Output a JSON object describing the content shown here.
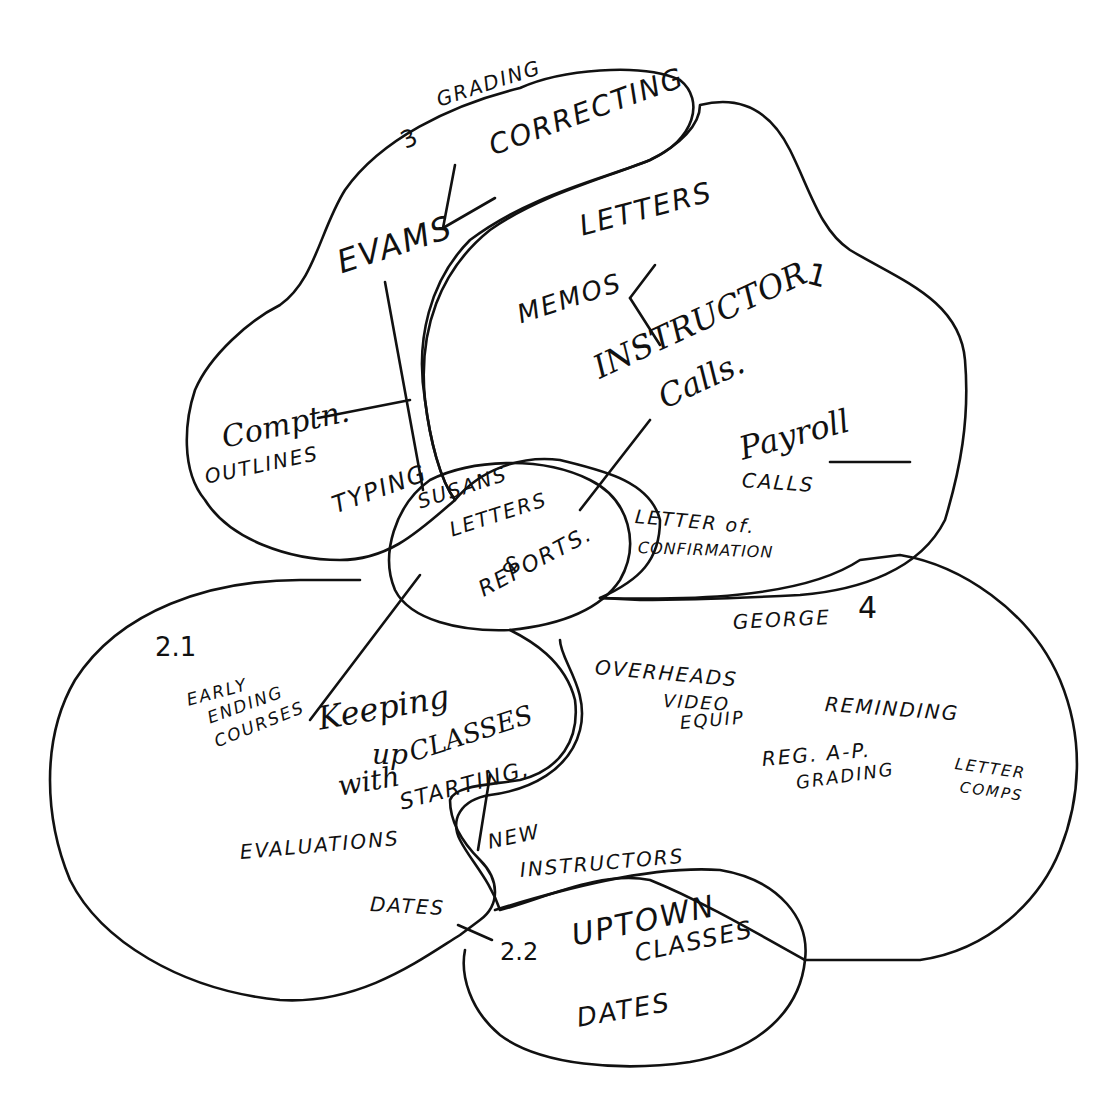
{
  "diagram": {
    "type": "hand-drawn cluster / mind map",
    "colors": {
      "ink": "#111111",
      "paper": "#ffffff"
    },
    "regions": [
      {
        "id": "region-3",
        "number": "3",
        "items": [
          "GRADING",
          "CORRECTING",
          "EVAMS",
          "COMPTN.",
          "OUTLINES",
          "TYPING"
        ]
      },
      {
        "id": "region-1",
        "number": "1",
        "items": [
          "LETTERS",
          "MEMOS",
          "INSTRUCTOR",
          "CALLS.",
          "Payroll",
          "CALLS",
          "LETTER of.",
          "CONFIRMATION"
        ]
      },
      {
        "id": "center",
        "number": "",
        "items": [
          "SUSANS",
          "LETTERS",
          "&",
          "REPORTS."
        ]
      },
      {
        "id": "region-2-1",
        "number": "2.1",
        "items": [
          "EARLY",
          "ENDING",
          "COURSES",
          "Keeping",
          "up",
          "with",
          "CLASSES",
          "STARTING,",
          "EVALUATIONS",
          "DATES",
          "NEW",
          "INSTRUCTORS"
        ]
      },
      {
        "id": "region-4",
        "number": "4",
        "items": [
          "GEORGE",
          "OVERHEADS",
          "VIDEO",
          "EQUIP",
          "REMINDING",
          "REG. A-P.",
          "GRADING",
          "LETTER",
          "COMPS"
        ]
      },
      {
        "id": "region-2-2",
        "number": "2.2",
        "items": [
          "UPTOWN",
          "CLASSES",
          "DATES"
        ]
      }
    ]
  },
  "labels": {
    "r3_num": "3",
    "r3_grading": "GRADING",
    "r3_correcting": "CORRECTING",
    "r3_evams": "EVAMS",
    "r3_comptn": "Comptn.",
    "r3_outlines": "OUTLINES",
    "r3_typing": "TYPING",
    "r1_num": "1",
    "r1_letters": "LETTERS",
    "r1_memos": "MEMOS",
    "r1_instructor": "INSTRUCTOR",
    "r1_calls": "Calls.",
    "r1_payroll": "Payroll",
    "r1_payroll_calls": "CALLS",
    "r1_letter_of": "LETTER of.",
    "r1_confirmation": "CONFIRMATION",
    "c_susans": "SUSANS",
    "c_letters": "LETTERS",
    "c_and": "&",
    "c_reports": "REPORTS.",
    "r21_num": "2.1",
    "r21_early": "EARLY",
    "r21_ending": "ENDING",
    "r21_courses": "COURSES",
    "r21_keeping": "Keeping",
    "r21_up": "up",
    "r21_with": "with",
    "r21_classes": "CLASSES",
    "r21_starting": "STARTING,",
    "r21_evaluations": "EVALUATIONS",
    "r21_dates": "DATES",
    "r21_new": "NEW",
    "r21_instructors": "INSTRUCTORS",
    "r4_num": "4",
    "r4_george": "GEORGE",
    "r4_overheads": "OVERHEADS",
    "r4_video": "VIDEO",
    "r4_equip": "EQUIP",
    "r4_reminding": "REMINDING",
    "r4_regap": "REG. A-P.",
    "r4_grading": "GRADING",
    "r4_letter": "LETTER",
    "r4_comps": "COMPS",
    "r22_num": "2.2",
    "r22_uptown": "UPTOWN",
    "r22_classes": "CLASSES",
    "r22_dates": "DATES"
  }
}
